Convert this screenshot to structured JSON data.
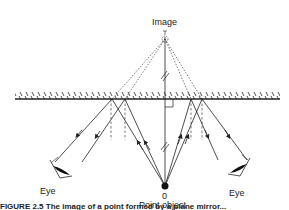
{
  "labels": {
    "image": "Image",
    "object_number": "0",
    "point_object": "Point object",
    "eye_left": "Eye",
    "eye_right": "Eye",
    "caption": "FIGURE 2.5   The image of a point formed by a plane mirror..."
  },
  "colors": {
    "line": "#222222",
    "background": "#ffffff"
  },
  "geometry": {
    "mirror_y": 99,
    "image_point": [
      165,
      37
    ],
    "object_point": [
      165,
      186
    ]
  }
}
